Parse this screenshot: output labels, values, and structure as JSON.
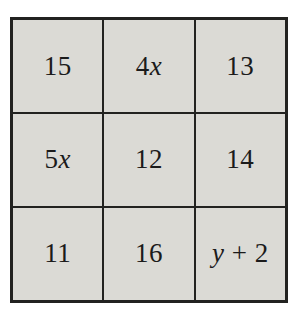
{
  "figure": {
    "rows": [
      [
        "15",
        "4x",
        "13"
      ],
      [
        "5x",
        "12",
        "14"
      ],
      [
        "11",
        "16",
        "y + 2"
      ]
    ],
    "colors": {
      "page_background": "#ffffff",
      "cell_background": "#dbdad5",
      "grid_line": "#222220",
      "text": "#1b1b1b"
    }
  }
}
